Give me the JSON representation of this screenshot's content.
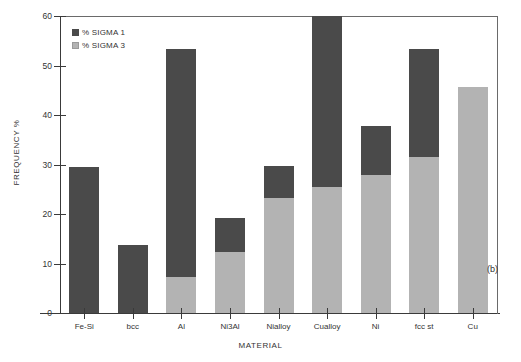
{
  "figure": {
    "panel_label": "(b)"
  },
  "legend": {
    "position": "top-left-inside",
    "items": [
      {
        "label": "% SIGMA 1",
        "color": "#4a4a4a"
      },
      {
        "label": "% SIGMA 3",
        "color": "#b3b3b3"
      }
    ]
  },
  "axes": {
    "ylabel": "FREQUENCY %",
    "xlabel": "MATERIAL",
    "yticks": [
      0,
      10,
      20,
      30,
      40,
      50,
      60
    ],
    "ylim": [
      0,
      60
    ]
  },
  "chart_data": {
    "type": "bar",
    "title": "",
    "subtitle": "",
    "xlabel": "MATERIAL",
    "ylabel": "FREQUENCY %",
    "ylim": [
      0,
      60
    ],
    "ytick_labels": [
      "0",
      "10",
      "20",
      "30",
      "40",
      "50",
      "60"
    ],
    "grid": false,
    "stacked": true,
    "legend_position": "top-left-inside",
    "categories": [
      "Fe-Si",
      "bcc",
      "Al",
      "Ni3Al",
      "Nialloy",
      "Cualloy",
      "Ni",
      "fcc st",
      "Cu"
    ],
    "series": [
      {
        "name": "% SIGMA 3",
        "color": "#b3b3b3",
        "values": [
          0,
          0,
          7.3,
          12.4,
          23.3,
          25.5,
          27.8,
          31.5,
          45.7
        ]
      },
      {
        "name": "% SIGMA 1",
        "color": "#4a4a4a",
        "values": [
          29.4,
          13.8,
          46.1,
          6.7,
          6.4,
          34.5,
          9.9,
          21.9,
          0
        ]
      }
    ],
    "totals": [
      29.4,
      13.8,
      53.4,
      19.1,
      29.7,
      60.0,
      37.7,
      53.4,
      45.7
    ]
  }
}
